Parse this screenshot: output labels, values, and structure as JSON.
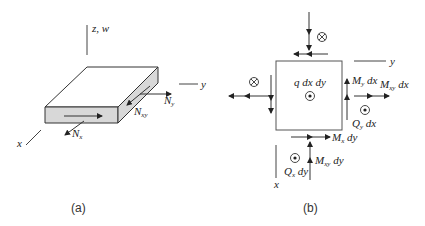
{
  "panel_a": {
    "caption": "(a)",
    "axes": {
      "z_label": "z, w",
      "y_label": "y",
      "x_label": "x"
    },
    "forces": {
      "Nx": {
        "main": "N",
        "sub": "x"
      },
      "Ny": {
        "main": "N",
        "sub": "y"
      },
      "Nxy": {
        "main": "N",
        "sub": "xy"
      }
    }
  },
  "panel_b": {
    "caption": "(b)",
    "axes": {
      "y_label": "y",
      "x_label": "x"
    },
    "load": "q dx dy",
    "moments": {
      "My": {
        "main": "M",
        "sub": "y",
        "tail": " dx"
      },
      "Mxy_dx": {
        "main": "M",
        "sub": "xy",
        "tail": " dx"
      },
      "Mx": {
        "main": "M",
        "sub": "x",
        "tail": " dy"
      },
      "Mxy_dy": {
        "main": "M",
        "sub": "xy",
        "tail": " dy"
      }
    },
    "shears": {
      "Qy": {
        "main": "Q",
        "sub": "y",
        "tail": " dx"
      },
      "Qx": {
        "main": "Q",
        "sub": "x",
        "tail": " dy"
      }
    },
    "symbols": {
      "into_page": "circle-cross",
      "out_of_page": "circle-dot"
    }
  },
  "colors": {
    "line": "#333333",
    "face_fill": "#d8d8d8",
    "background": "#ffffff"
  }
}
